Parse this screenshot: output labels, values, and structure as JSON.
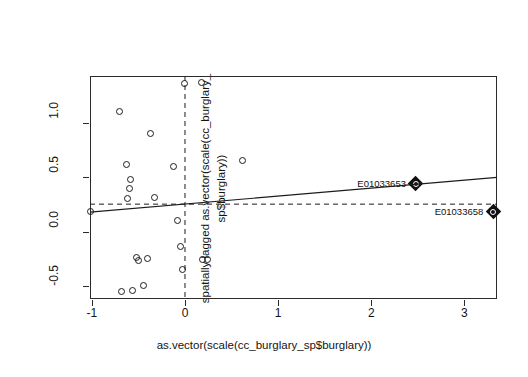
{
  "chart_data": {
    "type": "scatter",
    "title": "",
    "xlabel": "as.vector(scale(cc_burglary_sp$burglary))",
    "ylabel_line1": "spatially lagged as.vector(scale(cc_burglary_",
    "ylabel_line2": "sp$burglary))",
    "xlim": [
      -1.02,
      3.35
    ],
    "ylim": [
      -0.62,
      1.43
    ],
    "xticks": [
      -1,
      0,
      1,
      2,
      3
    ],
    "xticklabels": [
      "-1",
      "0",
      "1",
      "2",
      "3"
    ],
    "yticks": [
      -0.5,
      0.0,
      0.5,
      1.0
    ],
    "yticklabels": [
      "-0.5",
      "0.0",
      "0.5",
      "1.0"
    ],
    "grid": false,
    "legend": "none",
    "marker": "open-circle",
    "point_color": "#1c1c1c",
    "line_color": "#1c1c1c",
    "points": [
      {
        "x": -1.01,
        "y": 0.18
      },
      {
        "x": -0.7,
        "y": 1.1
      },
      {
        "x": -0.63,
        "y": 0.62
      },
      {
        "x": -0.62,
        "y": 0.3
      },
      {
        "x": -0.58,
        "y": 0.48
      },
      {
        "x": -0.6,
        "y": 0.4
      },
      {
        "x": -0.52,
        "y": -0.24
      },
      {
        "x": -0.5,
        "y": -0.27
      },
      {
        "x": -0.4,
        "y": -0.25
      },
      {
        "x": -0.37,
        "y": 0.9
      },
      {
        "x": -0.33,
        "y": 0.31
      },
      {
        "x": -0.68,
        "y": -0.55
      },
      {
        "x": -0.56,
        "y": -0.54
      },
      {
        "x": -0.45,
        "y": -0.5
      },
      {
        "x": -0.12,
        "y": 0.6
      },
      {
        "x": -0.08,
        "y": 0.1
      },
      {
        "x": -0.05,
        "y": -0.14
      },
      {
        "x": -0.03,
        "y": -0.35
      },
      {
        "x": 0.0,
        "y": 1.36
      },
      {
        "x": 0.18,
        "y": 1.37
      },
      {
        "x": 0.19,
        "y": -0.26
      },
      {
        "x": 0.24,
        "y": -0.26
      },
      {
        "x": 0.62,
        "y": 0.65
      }
    ],
    "highlighted_points": [
      {
        "label": "E01033653",
        "x": 2.48,
        "y": 0.44
      },
      {
        "label": "E01033658",
        "x": 3.31,
        "y": 0.18
      }
    ],
    "regression_line": {
      "x0": -1.02,
      "y0": 0.178,
      "x1": 3.35,
      "y1": 0.498
    },
    "reference_lines": [
      {
        "orientation": "vertical",
        "value": 0.0,
        "style": "dashed"
      },
      {
        "orientation": "horizontal",
        "value": 0.252,
        "style": "dashed"
      }
    ]
  }
}
